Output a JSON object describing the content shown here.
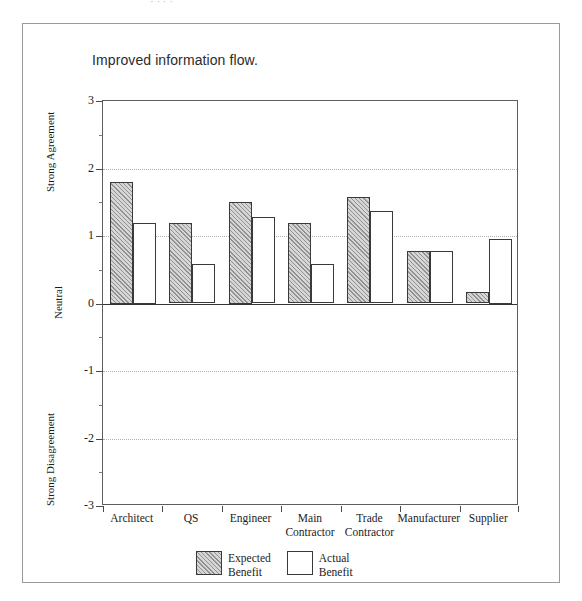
{
  "page": {
    "top_cut_text": "· ·   ·   ·",
    "background_color": "#ffffff",
    "frame_color": "#9a9a9a"
  },
  "chart_data": {
    "type": "bar",
    "title": "Improved information flow.",
    "xlabel": "",
    "ylabel": "",
    "ylim": [
      -3,
      3
    ],
    "yticks": [
      3,
      2,
      1,
      0,
      -1,
      -2,
      -3
    ],
    "ytick_labels": [
      "3",
      "2",
      "1",
      "0",
      "-1",
      "-2",
      "-3"
    ],
    "y_axis_annotations": [
      {
        "label": "Strong\nAgreement",
        "value": 2.45
      },
      {
        "label": "Neutral",
        "value": 0.0
      },
      {
        "label": "Strong\nDisagreement",
        "value": -2.45
      }
    ],
    "grid": "horizontal-dotted at -2,-1,1,2",
    "legend_position": "below-axis-center",
    "categories": [
      "Architect",
      "QS",
      "Engineer",
      "Main\nContractor",
      "Trade\nContractor",
      "Manufacturer",
      "Supplier"
    ],
    "series": [
      {
        "name": "Expected\nBenefit",
        "fill": "hatched-gray",
        "color": "#d6d6d6",
        "values": [
          1.8,
          1.19,
          1.5,
          1.19,
          1.58,
          0.78,
          0.17
        ]
      },
      {
        "name": "Actual\nBenefit",
        "fill": "white",
        "color": "#ffffff",
        "values": [
          1.2,
          0.59,
          1.28,
          0.59,
          1.37,
          0.78,
          0.95
        ]
      }
    ]
  },
  "legend": {
    "items": [
      {
        "label": "Expected\nBenefit",
        "swatch": "expected"
      },
      {
        "label": "Actual\nBenefit",
        "swatch": "actual"
      }
    ]
  }
}
